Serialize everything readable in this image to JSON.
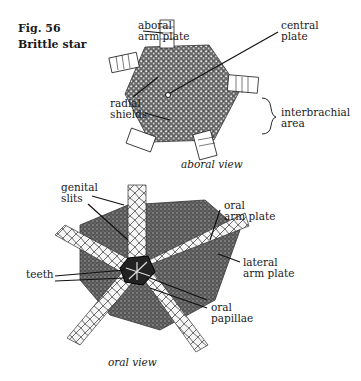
{
  "figure": {
    "number": "Fig. 56",
    "title": "Brittle star"
  },
  "aboral": {
    "view_label": "aboral view",
    "labels": {
      "aboral_arm_plate": "aboral\narm plate",
      "central_plate": "central\nplate",
      "radial_shields": "radial\nshields",
      "interbrachial_area": "interbrachial\narea"
    }
  },
  "oral": {
    "view_label": "oral view",
    "labels": {
      "genital_slits": "genital\nslits",
      "oral_arm_plate": "oral\narm plate",
      "lateral_arm_plate": "lateral\narm plate",
      "teeth": "teeth",
      "oral_papillae": "oral\npapillae"
    }
  }
}
